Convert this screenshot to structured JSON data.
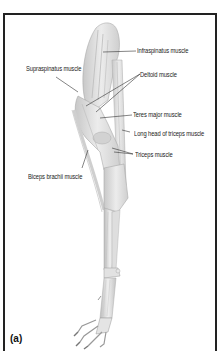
{
  "figure": {
    "panel_label": "(a)",
    "labels": [
      {
        "id": "infraspinatus",
        "text": "Infraspinatus muscle"
      },
      {
        "id": "supraspinatus",
        "text": "Supraspinatus muscle"
      },
      {
        "id": "deltoid",
        "text": "Deltoid muscle"
      },
      {
        "id": "teres_major",
        "text": "Teres major muscle"
      },
      {
        "id": "long_head_triceps",
        "text": "Long head of triceps muscle"
      },
      {
        "id": "triceps",
        "text": "Triceps muscle"
      },
      {
        "id": "biceps_brachii",
        "text": "Biceps brachii muscle"
      }
    ],
    "colors": {
      "border": "#222222",
      "muscle_fill": "#dcdcdc",
      "muscle_shade": "#bdbdbd",
      "bone_fill": "#e6e6e6",
      "leader_line": "#333333"
    }
  }
}
